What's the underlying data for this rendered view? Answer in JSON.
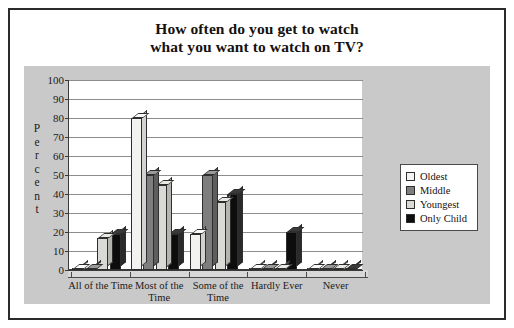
{
  "figure": {
    "title_line1": "How often do you get to watch",
    "title_line2": "what you want to watch on TV?"
  },
  "chart_data": {
    "type": "bar",
    "title": "How often do you get to watch what you want to watch on TV?",
    "xlabel": "",
    "ylabel": "Percent",
    "ylim": [
      0,
      100
    ],
    "yticks": [
      0,
      10,
      20,
      30,
      40,
      50,
      60,
      70,
      80,
      90,
      100
    ],
    "grid": true,
    "legend_position": "right",
    "categories": [
      "All of the Time",
      "Most of the Time",
      "Some of the Time",
      "Hardly Ever",
      "Never"
    ],
    "category_lines": [
      [
        "All of the Time"
      ],
      [
        "Most of the",
        "Time"
      ],
      [
        "Some of the",
        "Time"
      ],
      [
        "Hardly Ever"
      ],
      [
        "Never"
      ]
    ],
    "series": [
      {
        "name": "Oldest",
        "color": "#f2f2f0",
        "values": [
          0,
          80,
          19,
          0,
          0
        ]
      },
      {
        "name": "Middle",
        "color": "#7e7e7e",
        "values": [
          0,
          50,
          50,
          0,
          0
        ]
      },
      {
        "name": "Youngest",
        "color": "#d9d9d5",
        "values": [
          17,
          45,
          36,
          0,
          0
        ]
      },
      {
        "name": "Only Child",
        "color": "#0d0d0d",
        "values": [
          19,
          19,
          40,
          20,
          0
        ]
      }
    ]
  }
}
